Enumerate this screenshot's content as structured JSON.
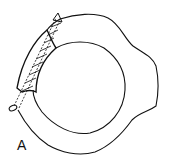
{
  "figure": {
    "panel_label": "A",
    "elements": [
      "outer-bone-contour",
      "inner-canal-contour",
      "fractured-fragment",
      "lag-screw"
    ],
    "colors": {
      "stroke": "#111111",
      "background": "#ffffff"
    }
  }
}
